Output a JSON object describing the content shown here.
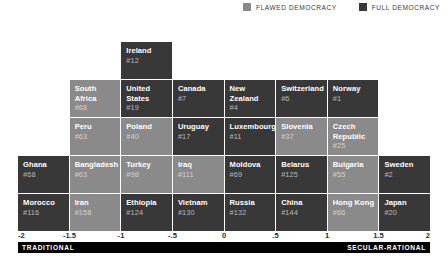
{
  "legend": {
    "items": [
      {
        "label": "FLAWED DEMOCRACY",
        "color": "#8a8a8a",
        "key": "flawed",
        "icon": "square-swatch-icon"
      },
      {
        "label": "FULL DEMOCRACY",
        "color": "#383838",
        "key": "full",
        "icon": "square-swatch-icon"
      }
    ]
  },
  "axis": {
    "left_label": "TRADITIONAL",
    "right_label": "SECULAR-RATIONAL",
    "ticks": [
      "-2",
      "-1.5",
      "-1",
      "-.5",
      "0",
      ".5",
      "1",
      "1.5",
      "2"
    ],
    "min": -2,
    "max": 2
  },
  "chart_data": {
    "type": "heatmap",
    "title": "",
    "subtitle": "",
    "xlabel": "",
    "ylabel": "",
    "xlim": [
      -2,
      2
    ],
    "grid": false,
    "legend_position": "top-right",
    "columns": 8,
    "rows": 5,
    "column_bins": [
      "-2 to -1.5",
      "-1.5 to -1",
      "-1 to -.5",
      "-.5 to 0",
      "0 to .5",
      ".5 to 1",
      "1 to 1.5",
      "1.5 to 2"
    ],
    "categories": [
      "FLAWED DEMOCRACY",
      "FULL DEMOCRACY"
    ],
    "cells": [
      [
        {
          "empty": true
        },
        {
          "empty": true
        },
        {
          "name": "Ireland",
          "rank": "#12",
          "type": "full"
        },
        {
          "empty": true
        },
        {
          "empty": true
        },
        {
          "empty": true
        },
        {
          "empty": true
        },
        {
          "empty": true
        }
      ],
      [
        {
          "empty": true
        },
        {
          "name": "South Africa",
          "rank": "#68",
          "type": "flawed"
        },
        {
          "name": "United States",
          "rank": "#19",
          "type": "full"
        },
        {
          "name": "Canada",
          "rank": "#7",
          "type": "full"
        },
        {
          "name": "New Zealand",
          "rank": "#4",
          "type": "full"
        },
        {
          "name": "Switzerland",
          "rank": "#6",
          "type": "full"
        },
        {
          "name": "Norway",
          "rank": "#1",
          "type": "full"
        },
        {
          "empty": true
        }
      ],
      [
        {
          "empty": true
        },
        {
          "name": "Peru",
          "rank": "#63",
          "type": "flawed"
        },
        {
          "name": "Poland",
          "rank": "#40",
          "type": "flawed"
        },
        {
          "name": "Uruguay",
          "rank": "#17",
          "type": "full"
        },
        {
          "name": "Luxembourg",
          "rank": "#11",
          "type": "full"
        },
        {
          "name": "Slovenia",
          "rank": "#37",
          "type": "flawed"
        },
        {
          "name": "Czech Republic",
          "rank": "#25",
          "type": "flawed"
        },
        {
          "empty": true
        }
      ],
      [
        {
          "name": "Ghana",
          "rank": "#68",
          "type": "full"
        },
        {
          "name": "Bangladesh",
          "rank": "#63",
          "type": "flawed"
        },
        {
          "name": "Turkey",
          "rank": "#98",
          "type": "flawed"
        },
        {
          "name": "Iraq",
          "rank": "#111",
          "type": "flawed"
        },
        {
          "name": "Moldova",
          "rank": "#69",
          "type": "full"
        },
        {
          "name": "Belarus",
          "rank": "#125",
          "type": "full"
        },
        {
          "name": "Bulgaria",
          "rank": "#55",
          "type": "flawed"
        },
        {
          "name": "Sweden",
          "rank": "#2",
          "type": "full"
        }
      ],
      [
        {
          "name": "Morocco",
          "rank": "#116",
          "type": "full"
        },
        {
          "name": "Iran",
          "rank": "#158",
          "type": "flawed"
        },
        {
          "name": "Ethiopia",
          "rank": "#124",
          "type": "full"
        },
        {
          "name": "Vietnam",
          "rank": "#130",
          "type": "full"
        },
        {
          "name": "Russia",
          "rank": "#132",
          "type": "full"
        },
        {
          "name": "China",
          "rank": "#144",
          "type": "full"
        },
        {
          "name": "Hong Kong",
          "rank": "#66",
          "type": "flawed"
        },
        {
          "name": "Japan",
          "rank": "#20",
          "type": "full"
        }
      ]
    ]
  }
}
